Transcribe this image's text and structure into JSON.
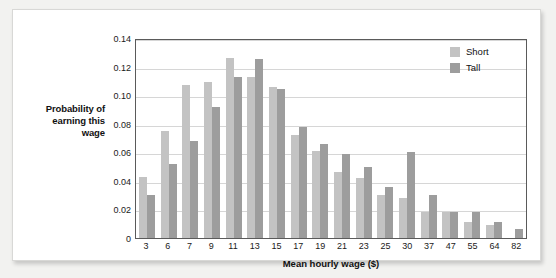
{
  "chart_data": {
    "type": "bar",
    "title": "",
    "xlabel": "Mean hourly wage ($)",
    "ylabel": "Probability of earning this wage",
    "ylabel_lines": [
      "Probability of",
      "earning this",
      "wage"
    ],
    "categories": [
      "3",
      "6",
      "7",
      "9",
      "11",
      "13",
      "15",
      "17",
      "19",
      "21",
      "23",
      "25",
      "30",
      "37",
      "47",
      "55",
      "64",
      "82"
    ],
    "series": [
      {
        "name": "Short",
        "color": "#c3c3c3",
        "values": [
          0.043,
          0.075,
          0.107,
          0.109,
          0.126,
          0.113,
          0.106,
          0.072,
          0.061,
          0.046,
          0.042,
          0.03,
          0.028,
          0.018,
          0.018,
          0.011,
          0.009,
          0.0
        ]
      },
      {
        "name": "Tall",
        "color": "#9d9d9d",
        "values": [
          0.03,
          0.052,
          0.068,
          0.092,
          0.113,
          0.125,
          0.104,
          0.078,
          0.066,
          0.059,
          0.05,
          0.036,
          0.06,
          0.03,
          0.018,
          0.018,
          0.011,
          0.006
        ]
      }
    ],
    "ylim": [
      0,
      0.14
    ],
    "yticks": [
      "0",
      "0.02",
      "0.04",
      "0.06",
      "0.08",
      "0.10",
      "0.12",
      "0.14"
    ],
    "ytick_values": [
      0,
      0.02,
      0.04,
      0.06,
      0.08,
      0.1,
      0.12,
      0.14
    ],
    "grid": true,
    "legend_position": "top-right"
  },
  "legend": {
    "items": [
      {
        "label": "Short",
        "color": "#c3c3c3"
      },
      {
        "label": "Tall",
        "color": "#9d9d9d"
      }
    ]
  },
  "colors": {
    "short": "#c3c3c3",
    "tall": "#9d9d9d",
    "axis": "#5a5a5a",
    "grid": "#d6d6d6",
    "page_background": "#f2f2f0",
    "card_background": "#ffffff"
  }
}
